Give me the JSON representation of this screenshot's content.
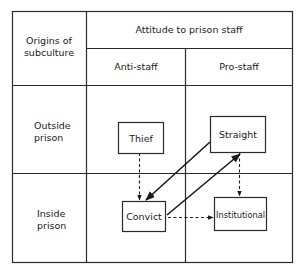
{
  "table": {
    "corner_header": [
      "Origins of",
      "subculture"
    ],
    "column_group_header": "Attitude to prison staff",
    "columns": [
      {
        "label": "Anti-staff"
      },
      {
        "label": "Pro-staff"
      }
    ],
    "rows": [
      {
        "label": [
          "Outside",
          "prison"
        ]
      },
      {
        "label": [
          "Inside",
          "prison"
        ]
      }
    ]
  },
  "nodes": [
    {
      "id": "thief",
      "label": "Thief",
      "row": "Outside prison",
      "column": "Anti-staff"
    },
    {
      "id": "straight",
      "label": "Straight",
      "row": "Outside prison",
      "column": "Pro-staff"
    },
    {
      "id": "convict",
      "label": "Convict",
      "row": "Inside prison",
      "column": "Anti-staff"
    },
    {
      "id": "institutional",
      "label": "Institutional",
      "row": "Inside prison",
      "column": "Pro-staff"
    }
  ],
  "edges": [
    {
      "from": "thief",
      "to": "convict",
      "style": "dashed"
    },
    {
      "from": "straight",
      "to": "convict",
      "style": "solid"
    },
    {
      "from": "convict",
      "to": "straight",
      "style": "solid"
    },
    {
      "from": "straight",
      "to": "institutional",
      "style": "dashed"
    },
    {
      "from": "convict",
      "to": "institutional",
      "style": "dashed"
    }
  ],
  "colors": {
    "line": "#2a2a2a",
    "text": "#1a1a1a",
    "background": "#ffffff"
  }
}
